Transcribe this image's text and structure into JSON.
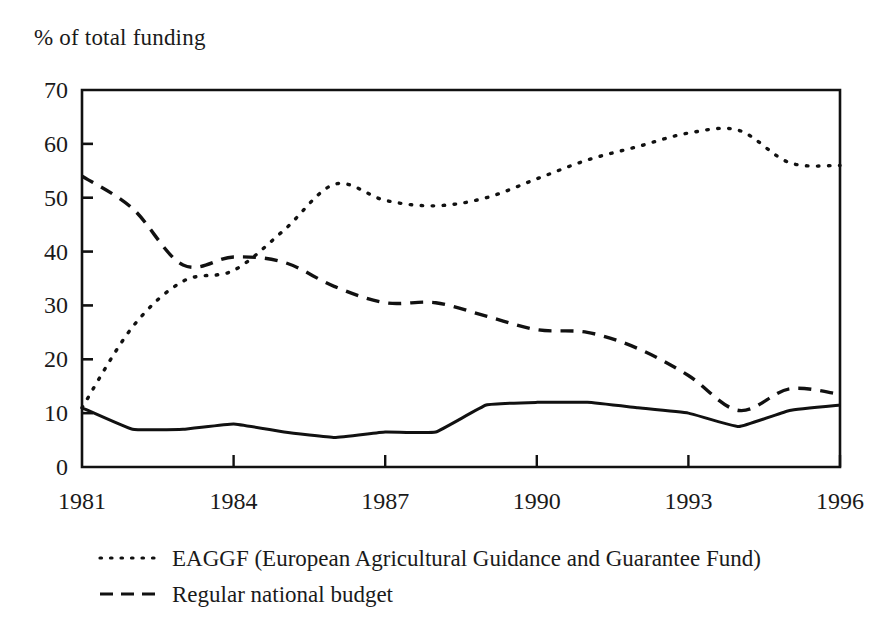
{
  "figure": {
    "axis_title": "% of total funding",
    "ink_color": "#111111",
    "background_color": "#ffffff"
  },
  "legend": {
    "entries": [
      {
        "label": "EAGGF (European Agricultural Guidance and Guarantee Fund)",
        "style": "dotted"
      },
      {
        "label": "Regular national budget",
        "style": "dashed"
      }
    ]
  },
  "chart_data": {
    "type": "line",
    "title": "",
    "subtitle": "",
    "xlabel": "",
    "ylabel": "% of total funding",
    "xlim": [
      1981,
      1996
    ],
    "ylim": [
      0,
      70
    ],
    "yticks": [
      0,
      10,
      20,
      30,
      40,
      50,
      60,
      70
    ],
    "xticks": [
      1981,
      1984,
      1987,
      1990,
      1993,
      1996
    ],
    "xtick_labels": [
      "1981",
      "1984",
      "1987",
      "1990",
      "1993",
      "1996"
    ],
    "ytick_labels": [
      "0",
      "10",
      "20",
      "30",
      "40",
      "50",
      "60",
      "70"
    ],
    "grid": false,
    "legend_position": "below-left",
    "x": [
      1981,
      1982,
      1983,
      1984,
      1985,
      1986,
      1987,
      1988,
      1989,
      1990,
      1991,
      1992,
      1993,
      1994,
      1995,
      1996
    ],
    "series": [
      {
        "name": "EAGGF (European Agricultural Guidance and Guarantee Fund)",
        "style": "dotted",
        "values": [
          11.0,
          26.0,
          34.5,
          36.5,
          44.0,
          52.5,
          49.5,
          48.5,
          50.0,
          53.5,
          57.0,
          59.5,
          62.0,
          62.5,
          56.5,
          56.0
        ]
      },
      {
        "name": "Regular national budget",
        "style": "dashed",
        "values": [
          54.0,
          48.0,
          37.5,
          39.0,
          38.0,
          33.5,
          30.5,
          30.5,
          28.0,
          25.5,
          25.0,
          22.0,
          17.0,
          10.5,
          14.5,
          13.5
        ]
      },
      {
        "name": "",
        "style": "solid",
        "values": [
          11.0,
          7.0,
          7.0,
          8.0,
          6.5,
          5.5,
          6.5,
          6.5,
          11.5,
          12.0,
          12.0,
          11.0,
          10.0,
          7.5,
          10.5,
          11.5
        ]
      }
    ]
  }
}
